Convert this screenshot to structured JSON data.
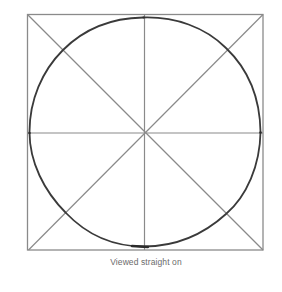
{
  "figure": {
    "caption": "Viewed straight on",
    "colors": {
      "background": "#ffffff",
      "guide_lines": "#8a8a8a",
      "circle_stroke": "#3a3a3a",
      "caption_text": "#6b6b6b"
    },
    "square": {
      "x1": 27,
      "y1": 14,
      "x2": 263,
      "y2": 250
    },
    "center": {
      "x": 145,
      "y": 133
    },
    "circle": {
      "cx": 145,
      "cy": 132,
      "rx": 116,
      "ry": 115
    },
    "guides": [
      "diagonal-top-left-to-bottom-right",
      "diagonal-top-right-to-bottom-left",
      "vertical-center",
      "horizontal-center"
    ]
  }
}
